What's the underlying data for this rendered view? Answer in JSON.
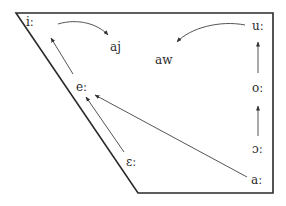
{
  "diagram": {
    "type": "vowel-shift-trapezoid",
    "colors": {
      "line": "#2a2a2a",
      "arrow": "#555555",
      "text": "#2a2a2a"
    },
    "trapezoid": {
      "points": [
        [
          16,
          13
        ],
        [
          273,
          13
        ],
        [
          273,
          193
        ],
        [
          138,
          193
        ]
      ]
    },
    "vowels": [
      {
        "id": "i",
        "label": "iː",
        "x": 26,
        "y": 16
      },
      {
        "id": "aj",
        "label": "aj",
        "x": 110,
        "y": 41
      },
      {
        "id": "aw",
        "label": "aw",
        "x": 155,
        "y": 54
      },
      {
        "id": "u",
        "label": "uː",
        "x": 252,
        "y": 20
      },
      {
        "id": "e",
        "label": "eː",
        "x": 76,
        "y": 81
      },
      {
        "id": "o",
        "label": "oː",
        "x": 252,
        "y": 82
      },
      {
        "id": "epsilon",
        "label": "ɛː",
        "x": 126,
        "y": 156
      },
      {
        "id": "open-o",
        "label": "ɔː",
        "x": 252,
        "y": 143
      },
      {
        "id": "a",
        "label": "aː",
        "x": 251,
        "y": 174
      }
    ],
    "arrows": [
      {
        "from": "iː",
        "to": "aj",
        "curved": true
      },
      {
        "from": "uː",
        "to": "aw",
        "curved": true
      },
      {
        "from": "eː",
        "to": "iː",
        "curved": false
      },
      {
        "from": "ɛː",
        "to": "eː",
        "curved": false
      },
      {
        "from": "aː",
        "to": "eː",
        "curved": false
      },
      {
        "from": "oː",
        "to": "uː",
        "curved": false
      },
      {
        "from": "ɔː",
        "to": "oː",
        "curved": false
      }
    ]
  }
}
